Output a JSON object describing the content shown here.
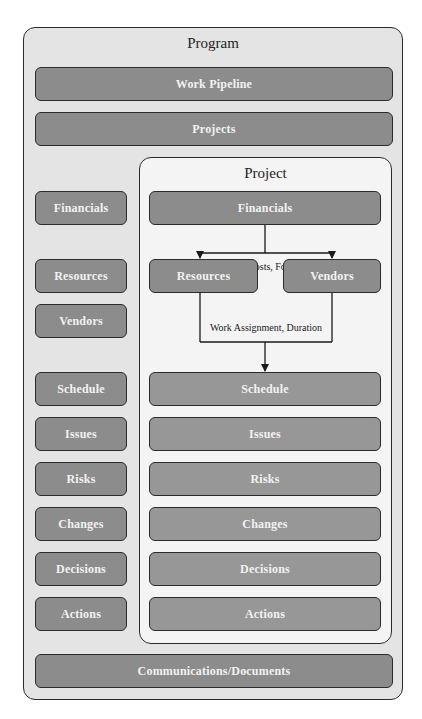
{
  "program": {
    "title": "Program",
    "top_bars": [
      {
        "label": "Work Pipeline"
      },
      {
        "label": "Projects"
      }
    ],
    "left_column": [
      {
        "label": "Financials"
      },
      {
        "label": "Resources"
      },
      {
        "label": "Vendors"
      },
      {
        "label": "Schedule"
      },
      {
        "label": "Issues"
      },
      {
        "label": "Risks"
      },
      {
        "label": "Changes"
      },
      {
        "label": "Decisions"
      },
      {
        "label": "Actions"
      }
    ],
    "bottom_bar": {
      "label": "Communications/Documents"
    }
  },
  "project": {
    "title": "Project",
    "financials": {
      "label": "Financials"
    },
    "resources": {
      "label": "Resources"
    },
    "vendors": {
      "label": "Vendors"
    },
    "flow_labels": {
      "financials_to_resources_vendors": "Actual Costs, Forecasts",
      "resources_vendors_to_schedule": "Work Assignment, Duration"
    },
    "stack": [
      {
        "label": "Schedule"
      },
      {
        "label": "Issues"
      },
      {
        "label": "Risks"
      },
      {
        "label": "Changes"
      },
      {
        "label": "Decisions"
      },
      {
        "label": "Actions"
      }
    ]
  },
  "colors": {
    "program_bg": "#e4e4e4",
    "project_bg": "#f4f4f4",
    "box_fill": "#8c8c8c",
    "box_text": "#f2f2f2",
    "border": "#2b2b2b"
  }
}
